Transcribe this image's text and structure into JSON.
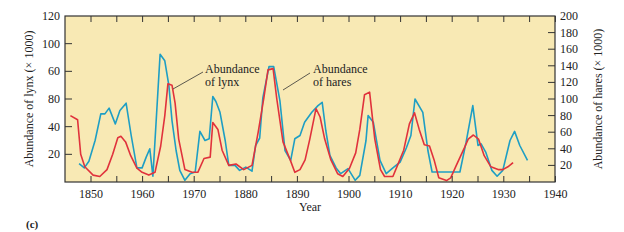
{
  "figure": {
    "panel_label": "(c)",
    "background": "#f8e9b4",
    "frame_color": "#333333"
  },
  "chart_data": {
    "type": "line",
    "title": "",
    "xlabel": "Year",
    "ylabel_left": "Abundance of lynx (× 1000)",
    "ylabel_right": "Abundance of hares (× 1000)",
    "x_tick_labels": [
      "1850",
      "1960",
      "1970",
      "1880",
      "1890",
      "1900",
      "1910",
      "1920",
      "1930",
      "1940"
    ],
    "x_tick_positions": [
      1850,
      1860,
      1870,
      1880,
      1890,
      1900,
      1910,
      1920,
      1930,
      1940
    ],
    "xlim": [
      1845,
      1942
    ],
    "y_left_tick_labels": [
      "120",
      "100",
      "60",
      "80",
      "40",
      "20"
    ],
    "y_left_tick_positions": [
      120,
      100,
      80,
      60,
      40,
      20
    ],
    "ylim_left": [
      0,
      120
    ],
    "y_right_tick_labels": [
      "200",
      "180",
      "160",
      "140",
      "120",
      "100",
      "80",
      "60",
      "40",
      "20"
    ],
    "y_right_tick_positions": [
      200,
      180,
      160,
      140,
      120,
      100,
      80,
      60,
      40,
      20
    ],
    "ylim_right": [
      0,
      200
    ],
    "grid": false,
    "annotations": [
      {
        "text_lines": [
          "Abundance",
          "of lynx"
        ],
        "points_to": "lynx"
      },
      {
        "text_lines": [
          "Abundance",
          "of hares"
        ],
        "points_to": "hares"
      }
    ],
    "series": [
      {
        "name": "Abundance of lynx",
        "axis": "left",
        "color": "#e0323c",
        "x": [
          1846,
          1847.4,
          1848,
          1848.8,
          1850.4,
          1851.7,
          1853.1,
          1854.2,
          1855.2,
          1855.8,
          1856.7,
          1857.7,
          1858.9,
          1859.9,
          1861.2,
          1862.4,
          1863.5,
          1864.3,
          1864.9,
          1865.7,
          1866.3,
          1867,
          1868.2,
          1869.6,
          1870.7,
          1871.9,
          1873.1,
          1873.6,
          1874.6,
          1875.4,
          1876.7,
          1878.1,
          1879.6,
          1881.2,
          1882.4,
          1883.5,
          1884.3,
          1885.3,
          1886,
          1887.2,
          1888.6,
          1889.5,
          1890.5,
          1891.5,
          1892.4,
          1893.6,
          1894.4,
          1895.3,
          1896.5,
          1897.8,
          1898.8,
          1900.1,
          1901.3,
          1902.1,
          1903,
          1904,
          1905,
          1906.1,
          1906.9,
          1908.5,
          1909.4,
          1910.6,
          1911.7,
          1912.7,
          1913.6,
          1914.6,
          1915.6,
          1916.5,
          1917.4,
          1918.9,
          1919.7,
          1920.8,
          1922.4,
          1923.1,
          1924.1,
          1925.1,
          1926.2,
          1927.5,
          1928.9,
          1929.8,
          1930.8,
          1931.8
        ],
        "values": [
          48,
          45,
          20,
          11,
          5,
          4,
          9,
          20,
          32,
          33,
          29,
          19,
          10,
          7,
          5,
          7,
          26,
          48,
          71,
          70,
          57,
          31,
          9,
          7,
          7,
          17,
          18,
          43,
          38,
          23,
          12,
          13,
          9,
          12,
          36,
          61,
          81,
          82,
          60,
          29,
          16,
          7,
          9,
          16,
          31,
          53,
          47,
          31,
          16,
          6,
          4,
          10,
          21,
          38,
          63,
          65,
          31,
          9,
          4,
          4,
          12,
          23,
          42,
          50,
          38,
          27,
          26,
          16,
          3,
          1,
          3,
          12,
          25,
          31,
          34,
          31,
          19,
          11,
          9,
          9,
          11,
          14
        ]
      },
      {
        "name": "Abundance of hares",
        "axis": "right",
        "color": "#1e9ec4",
        "x": [
          1847.7,
          1848.7,
          1849.6,
          1850.8,
          1851.9,
          1852.7,
          1853.5,
          1854.7,
          1855.6,
          1856.8,
          1857.8,
          1858.9,
          1859.9,
          1860.7,
          1861.4,
          1862,
          1863.4,
          1864.3,
          1865.1,
          1865.7,
          1866.5,
          1867.2,
          1868.2,
          1869.2,
          1870.2,
          1871.1,
          1872.1,
          1872.9,
          1873.6,
          1874.2,
          1875,
          1876,
          1876.7,
          1877.9,
          1878.8,
          1880,
          1881.2,
          1881.9,
          1882.7,
          1883.3,
          1884.5,
          1885.4,
          1886.6,
          1887.6,
          1888.7,
          1889.5,
          1890.5,
          1891.4,
          1892.8,
          1894,
          1894.8,
          1895.5,
          1896.3,
          1897.5,
          1898.4,
          1899.8,
          1901.2,
          1902.1,
          1903.3,
          1903.7,
          1904.7,
          1906,
          1907.2,
          1908.5,
          1909.9,
          1911.1,
          1912,
          1912.8,
          1914.3,
          1915.3,
          1916.1,
          1917.6,
          1921.5,
          1922.7,
          1924,
          1925,
          1925.6,
          1926.5,
          1927.7,
          1928.7,
          1929.8,
          1931.2,
          1932.1,
          1933.1,
          1934.6
        ],
        "values": [
          22,
          17,
          25,
          50,
          82,
          82,
          89,
          70,
          86,
          95,
          56,
          17,
          17,
          30,
          40,
          7,
          154,
          146,
          116,
          74,
          38,
          14,
          2,
          10,
          12,
          61,
          50,
          52,
          103,
          97,
          84,
          50,
          20,
          20,
          14,
          18,
          13,
          44,
          53,
          101,
          139,
          139,
          98,
          38,
          26,
          52,
          56,
          72,
          84,
          92,
          96,
          62,
          32,
          17,
          10,
          16,
          2,
          8,
          50,
          80,
          72,
          26,
          10,
          17,
          24,
          41,
          56,
          100,
          84,
          38,
          12,
          12,
          12,
          48,
          92,
          44,
          46,
          36,
          14,
          7,
          14,
          50,
          61,
          44,
          26
        ]
      }
    ]
  }
}
